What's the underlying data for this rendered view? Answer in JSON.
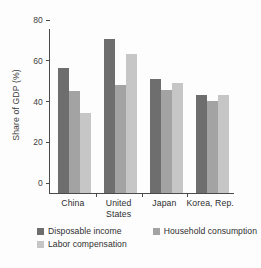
{
  "chart_data": {
    "type": "bar",
    "title": "",
    "xlabel": "",
    "ylabel": "Share of GDP (%)",
    "ylim": [
      0,
      80
    ],
    "yticks": [
      0,
      20,
      40,
      60,
      80
    ],
    "grid": false,
    "legend_position": "bottom-left",
    "categories": [
      "China",
      "United States",
      "Japan",
      "Korea, Rep."
    ],
    "category_lines": [
      [
        "China"
      ],
      [
        "United",
        "States"
      ],
      [
        "Japan"
      ],
      [
        "Korea, Rep."
      ]
    ],
    "series": [
      {
        "name": "Disposable income",
        "color": "#6e6e6e",
        "values": [
          61.5,
          75.5,
          56.0,
          48.0
        ]
      },
      {
        "name": "Household consumption",
        "color": "#a3a3a3",
        "values": [
          50.0,
          53.0,
          50.5,
          45.0
        ]
      },
      {
        "name": "Labor compensation",
        "color": "#c6c6c6",
        "values": [
          39.5,
          68.0,
          54.0,
          48.0
        ]
      }
    ]
  }
}
